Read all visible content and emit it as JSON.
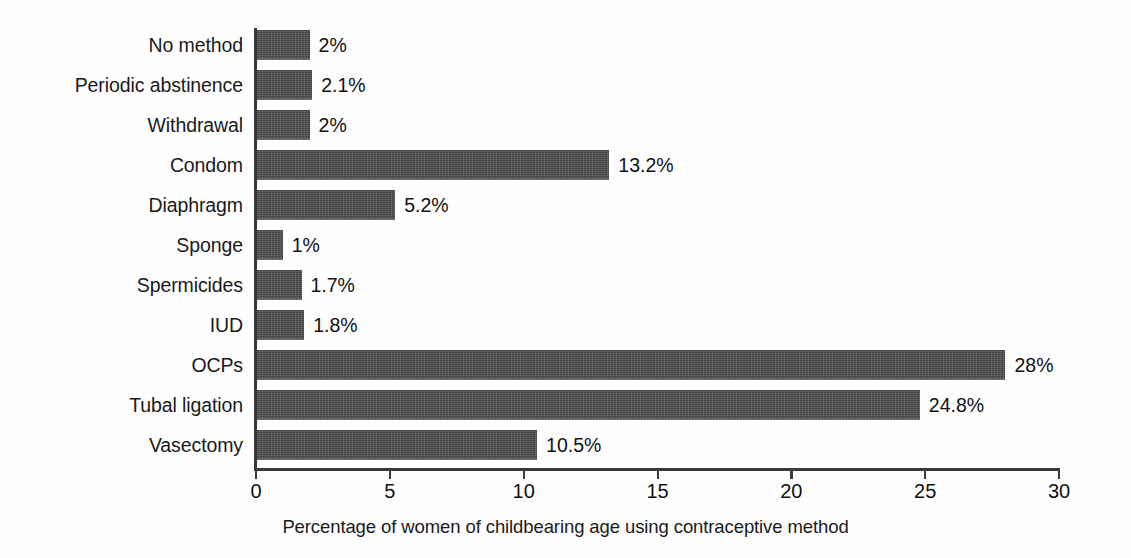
{
  "chart_data": {
    "type": "bar",
    "orientation": "horizontal",
    "title": "",
    "xlabel": "Percentage of women of childbearing age using contraceptive method",
    "ylabel": "",
    "xlim": [
      0,
      30
    ],
    "xticks": [
      0,
      5,
      10,
      15,
      20,
      25,
      30
    ],
    "xtick_labels": [
      "0",
      "5",
      "10",
      "15",
      "20",
      "25",
      "30"
    ],
    "grid": false,
    "legend": null,
    "bar_color": "#4c4c4c",
    "categories": [
      "No method",
      "Periodic abstinence",
      "Withdrawal",
      "Condom",
      "Diaphragm",
      "Sponge",
      "Spermicides",
      "IUD",
      "OCPs",
      "Tubal ligation",
      "Vasectomy"
    ],
    "values": [
      2,
      2.1,
      2,
      13.2,
      5.2,
      1,
      1.7,
      1.8,
      28,
      24.8,
      10.5
    ],
    "value_labels": [
      "2%",
      "2.1%",
      "2%",
      "13.2%",
      "5.2%",
      "1%",
      "1.7%",
      "1.8%",
      "28%",
      "24.8%",
      "10.5%"
    ]
  }
}
